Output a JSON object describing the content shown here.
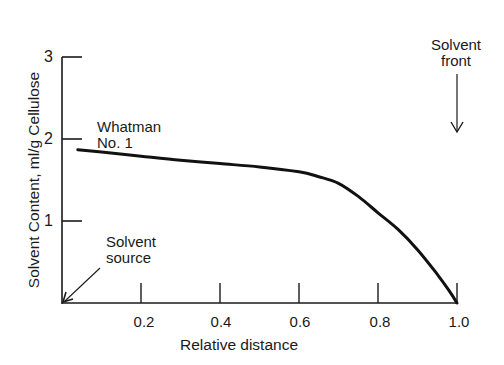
{
  "chart_data": {
    "type": "line",
    "title": "",
    "xlabel": "Relative distance",
    "ylabel": "Solvent Content,  ml/g  Cellulose",
    "xlim": [
      0,
      1.0
    ],
    "ylim": [
      0,
      3
    ],
    "x_ticks": [
      "0.2",
      "0.4",
      "0.6",
      "0.8",
      "1.0"
    ],
    "y_ticks": [
      "1",
      "2",
      "3"
    ],
    "grid": false,
    "series": [
      {
        "name": "Whatman No. 1",
        "x": [
          0.04,
          0.1,
          0.2,
          0.3,
          0.4,
          0.5,
          0.6,
          0.65,
          0.7,
          0.75,
          0.8,
          0.85,
          0.9,
          0.95,
          0.98,
          1.0
        ],
        "y": [
          1.87,
          1.84,
          1.79,
          1.74,
          1.7,
          1.66,
          1.6,
          1.54,
          1.46,
          1.3,
          1.1,
          0.9,
          0.65,
          0.35,
          0.15,
          0.0
        ]
      }
    ],
    "annotations": [
      {
        "text_line1": "Whatman",
        "text_line2": "No. 1",
        "target": "curve"
      },
      {
        "text_line1": "Solvent",
        "text_line2": "source",
        "arrow_to": [
          0,
          0
        ]
      },
      {
        "text_line1": "Solvent",
        "text_line2": "front",
        "arrow_to": [
          1.0,
          2.35
        ]
      }
    ]
  },
  "labels": {
    "xlabel": "Relative distance",
    "ylabel": "Solvent Content,  ml/g  Cellulose",
    "series_name_line1": "Whatman",
    "series_name_line2": "No. 1",
    "source_line1": "Solvent",
    "source_line2": "source",
    "front_line1": "Solvent",
    "front_line2": "front",
    "xtick_0": "0.2",
    "xtick_1": "0.4",
    "xtick_2": "0.6",
    "xtick_3": "0.8",
    "xtick_4": "1.0",
    "ytick_0": "1",
    "ytick_1": "2",
    "ytick_2": "3"
  }
}
